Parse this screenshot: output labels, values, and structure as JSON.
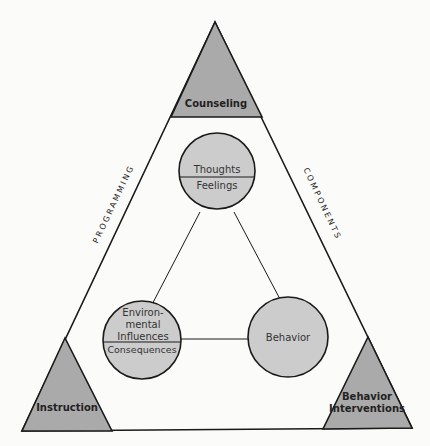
{
  "diagram": {
    "corners": {
      "top": "Counseling",
      "bottom_left": "Instruction",
      "bottom_right_line1": "Behavior",
      "bottom_right_line2": "Interventions"
    },
    "sides": {
      "left": "PROGRAMMING",
      "right": "COMPONENTS"
    },
    "nodes": {
      "top_upper": "Thoughts",
      "top_lower": "Feelings",
      "left_line1": "Environ-",
      "left_line2": "mental",
      "left_line3": "Influences",
      "left_lower": "Consequences",
      "right": "Behavior"
    },
    "colors": {
      "corner_fill": "#aaaaaa",
      "node_fill": "#cccccc",
      "line": "#1a1a1a",
      "background": "#fbfbf9"
    }
  }
}
